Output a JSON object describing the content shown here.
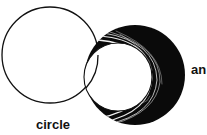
{
  "diagram": {
    "labels": {
      "left_circle": "circle",
      "right_shape": "an"
    },
    "colors": {
      "stroke": "#111111",
      "fill_dark": "#0a0a0a",
      "background": "#ffffff"
    }
  }
}
